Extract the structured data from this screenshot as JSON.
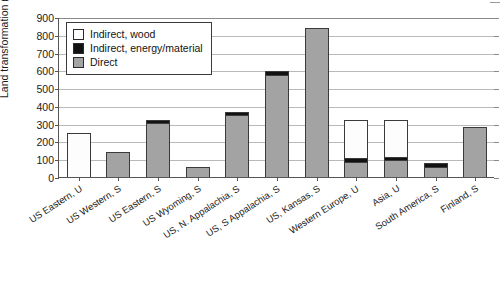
{
  "chart_data": {
    "type": "bar",
    "title": "",
    "xlabel": "",
    "ylabel": "Land transformation (m²/GWh)",
    "ylim": [
      0,
      900
    ],
    "ytick_step": 100,
    "yticks": [
      "0",
      "100",
      "200",
      "300",
      "400",
      "500",
      "600",
      "700",
      "800",
      "900"
    ],
    "grid": true,
    "stacked": true,
    "legend_position": "top-left-inside",
    "categories": [
      "US Eastern, U",
      "US Western, S",
      "US Eastern, S",
      "US Wyoming, S",
      "US, N. Appalachia, S",
      "US, S Appalachia, S",
      "US, Kansas, S",
      "Western Europe, U",
      "Asia, U",
      "South America, S",
      "Finland, S"
    ],
    "series": [
      {
        "name": "Direct",
        "color": "#a3a3a3",
        "values": [
          0,
          140,
          305,
          55,
          348,
          575,
          837,
          85,
          95,
          55,
          280
        ]
      },
      {
        "name": "Indirect, energy/material",
        "color": "#121212",
        "values": [
          0,
          0,
          14,
          0,
          17,
          20,
          0,
          20,
          18,
          22,
          0
        ]
      },
      {
        "name": "Indirect, wood",
        "color": "#ffffff",
        "values": [
          247,
          0,
          0,
          0,
          0,
          0,
          0,
          215,
          210,
          0,
          0
        ]
      }
    ],
    "totals": [
      247,
      140,
      319,
      55,
      365,
      595,
      837,
      320,
      323,
      77,
      280
    ]
  },
  "legend": {
    "items": [
      {
        "label": "Indirect, wood",
        "swatch": "wood"
      },
      {
        "label": "Indirect, energy/material",
        "swatch": "em"
      },
      {
        "label": "Direct",
        "swatch": "direct"
      }
    ]
  }
}
